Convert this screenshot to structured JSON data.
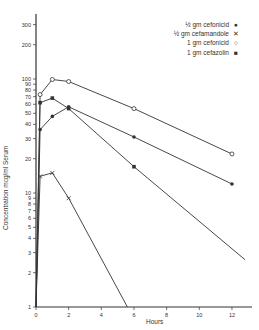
{
  "chart_data": {
    "type": "line",
    "title": "",
    "xlabel": "Hours",
    "ylabel": "Concentration mcg/ml Serum",
    "yscale": "log",
    "xlim": [
      0,
      13
    ],
    "ylim": [
      1,
      400
    ],
    "grid": false,
    "legend_position": "upper right",
    "x_ticks": [
      0,
      2,
      4,
      6,
      8,
      10,
      12
    ],
    "y_ticks": [
      1,
      2,
      3,
      4,
      5,
      6,
      7,
      8,
      9,
      10,
      20,
      30,
      40,
      50,
      60,
      70,
      80,
      90,
      100,
      200,
      300
    ],
    "series": [
      {
        "name": "½ gm cefonicid",
        "marker": "filled-circle",
        "x": [
          0,
          0.25,
          1,
          2,
          6,
          12
        ],
        "y": [
          1,
          36,
          47,
          57,
          31,
          12
        ]
      },
      {
        "name": "½ gm cefamandole",
        "marker": "x",
        "x": [
          0,
          0.25,
          1,
          2,
          5.6
        ],
        "y": [
          1,
          14,
          15,
          9,
          1
        ]
      },
      {
        "name": "1 gm cefonicid",
        "marker": "open-circle",
        "x": [
          0,
          0.25,
          1,
          2,
          6,
          12
        ],
        "y": [
          1,
          73,
          99,
          95,
          55,
          22
        ]
      },
      {
        "name": "1 gm cefazolin",
        "marker": "filled-square",
        "x": [
          0,
          0.25,
          1,
          2,
          6,
          12.8
        ],
        "y": [
          1,
          62,
          68,
          55,
          17,
          2.6
        ]
      }
    ]
  },
  "legend": [
    {
      "label": "½ gm cefonicid",
      "marker": "●"
    },
    {
      "label": "½ gm cefamandole",
      "marker": "✕"
    },
    {
      "label": "1 gm cefonicid",
      "marker": "○"
    },
    {
      "label": "1 gm cefazolin",
      "marker": "■"
    }
  ],
  "axis": {
    "xlabel": "Hours",
    "ylabel": "Concentration mcg/ml Serum"
  }
}
